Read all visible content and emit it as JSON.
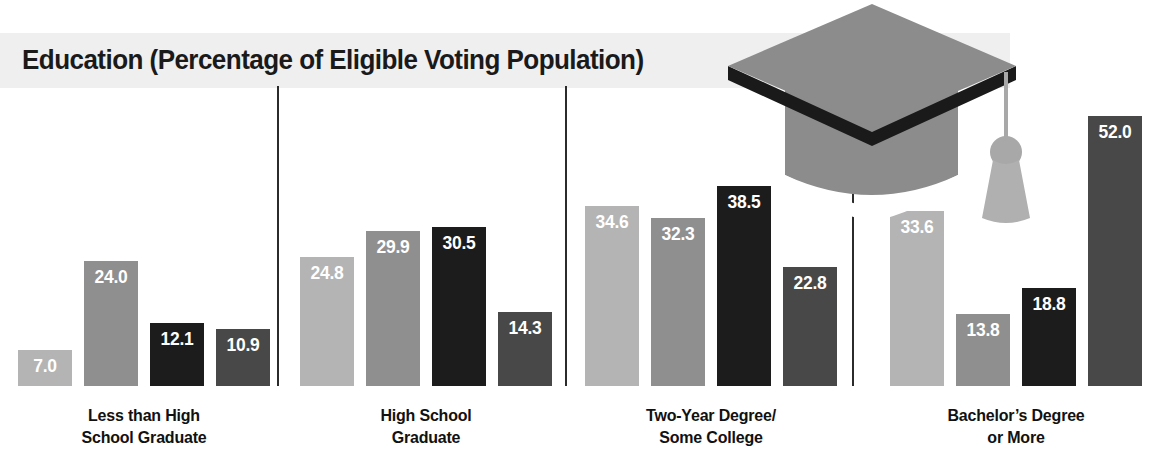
{
  "chart": {
    "title": "Education (Percentage of Eligible Voting Population)",
    "decoration": "graduation-cap-icon"
  },
  "chart_data": {
    "type": "bar",
    "title": "Education (Percentage of Eligible Voting Population)",
    "xlabel": "",
    "ylabel": "Percentage of Eligible Voting Population",
    "ylim": [
      0,
      55
    ],
    "grid": false,
    "legend": "none",
    "categories": [
      "Less than High School Graduate",
      "High School Graduate",
      "Two-Year Degree/Some College",
      "Bachelor's Degree or More"
    ],
    "series": [
      {
        "name": "Series 1",
        "color": "#b4b4b4",
        "values": [
          7.0,
          24.8,
          34.6,
          33.6
        ]
      },
      {
        "name": "Series 2",
        "color": "#8f8f8f",
        "values": [
          24.0,
          29.9,
          32.3,
          13.8
        ]
      },
      {
        "name": "Series 3",
        "color": "#1c1c1c",
        "values": [
          12.1,
          30.5,
          38.5,
          18.8
        ]
      },
      {
        "name": "Series 4",
        "color": "#484848",
        "values": [
          10.9,
          14.3,
          22.8,
          52.0
        ]
      }
    ],
    "groups": [
      {
        "label_line1": "Less than High",
        "label_line2": "School Graduate",
        "bars": [
          {
            "value": "7.0",
            "height": 7.0,
            "color": "#b4b4b4"
          },
          {
            "value": "24.0",
            "height": 24.0,
            "color": "#8f8f8f"
          },
          {
            "value": "12.1",
            "height": 12.1,
            "color": "#1c1c1c"
          },
          {
            "value": "10.9",
            "height": 10.9,
            "color": "#484848"
          }
        ]
      },
      {
        "label_line1": "High School",
        "label_line2": "Graduate",
        "bars": [
          {
            "value": "24.8",
            "height": 24.8,
            "color": "#b4b4b4"
          },
          {
            "value": "29.9",
            "height": 29.9,
            "color": "#8f8f8f"
          },
          {
            "value": "30.5",
            "height": 30.5,
            "color": "#1c1c1c"
          },
          {
            "value": "14.3",
            "height": 14.3,
            "color": "#484848"
          }
        ]
      },
      {
        "label_line1": "Two-Year Degree/",
        "label_line2": "Some College",
        "bars": [
          {
            "value": "34.6",
            "height": 34.6,
            "color": "#b4b4b4"
          },
          {
            "value": "32.3",
            "height": 32.3,
            "color": "#8f8f8f"
          },
          {
            "value": "38.5",
            "height": 38.5,
            "color": "#1c1c1c"
          },
          {
            "value": "22.8",
            "height": 22.8,
            "color": "#484848"
          }
        ]
      },
      {
        "label_line1": "Bachelor’s Degree",
        "label_line2": "or More",
        "bars": [
          {
            "value": "33.6",
            "height": 33.6,
            "color": "#b4b4b4"
          },
          {
            "value": "13.8",
            "height": 13.8,
            "color": "#8f8f8f"
          },
          {
            "value": "18.8",
            "height": 18.8,
            "color": "#1c1c1c"
          },
          {
            "value": "52.0",
            "height": 52.0,
            "color": "#484848"
          }
        ]
      }
    ]
  },
  "layout": {
    "pixels_per_unit": 5.2,
    "group_left_positions": [
      18,
      300,
      585,
      890
    ],
    "separator_positions": [
      277,
      565,
      852
    ],
    "title_band_color": "#efefef",
    "background_color": "#ffffff",
    "cap_gray": "#8c8c8c",
    "cap_dark": "#1a1a1a",
    "tassel_gray": "#b0b0b0"
  }
}
